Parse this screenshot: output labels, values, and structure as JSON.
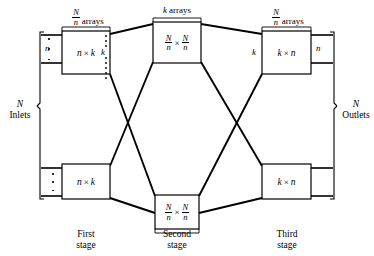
{
  "figure": {
    "type": "three-stage-clos-network-diagram",
    "stages": [
      {
        "id": "first",
        "stage_label_line1": "First",
        "stage_label_line2": "stage",
        "count_label": {
          "numerator": "N",
          "denominator": "n",
          "word": "arrays"
        },
        "boxes": [
          {
            "id": "first-top",
            "left": "n",
            "op": "×",
            "right": "k"
          },
          {
            "id": "first-bottom",
            "left": "n",
            "op": "×",
            "right": "k"
          }
        ],
        "input_port_label": "n",
        "output_port_label": "k"
      },
      {
        "id": "second",
        "stage_label_line1": "Second",
        "stage_label_line2": "stage",
        "count_label": {
          "numerator": "k",
          "denominator": "",
          "word": "arrays"
        },
        "boxes": [
          {
            "id": "second-top",
            "left_num": "N",
            "left_den": "n",
            "op": "×",
            "right_num": "N",
            "right_den": "n"
          },
          {
            "id": "second-bottom",
            "left_num": "N",
            "left_den": "n",
            "op": "×",
            "right_num": "N",
            "right_den": "n"
          }
        ]
      },
      {
        "id": "third",
        "stage_label_line1": "Third",
        "stage_label_line2": "stage",
        "count_label": {
          "numerator": "N",
          "denominator": "n",
          "word": "arrays"
        },
        "boxes": [
          {
            "id": "third-top",
            "left": "k",
            "op": "×",
            "right": "n"
          },
          {
            "id": "third-bottom",
            "left": "k",
            "op": "×",
            "right": "n"
          }
        ],
        "input_port_label": "k",
        "output_port_label": "n"
      }
    ],
    "inlets": {
      "symbol": "N",
      "word": "Inlets"
    },
    "outlets": {
      "symbol": "N",
      "word": "Outlets"
    },
    "top_center_label": {
      "symbol": "k",
      "word": "arrays"
    },
    "colors": {
      "stroke": "#000000",
      "background": "#ffffff"
    }
  }
}
